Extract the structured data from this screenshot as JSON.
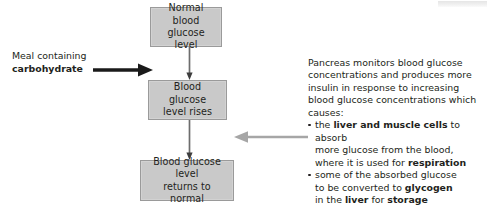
{
  "diagram": {
    "colors": {
      "box_fill": "#c9c9c9",
      "box_border": "#9a9a9a",
      "text": "#231f20",
      "black_arrow": "#1a1a1a",
      "gray_arrow": "#a6a6a6"
    },
    "boxes": [
      {
        "id": "normal",
        "line1": "Normal blood",
        "line2": "glucose level"
      },
      {
        "id": "rises",
        "line1": "Blood glucose",
        "line2": "level rises"
      },
      {
        "id": "returns",
        "line1": "Blood glucose level",
        "line2": "returns to normal"
      }
    ],
    "meal_label": {
      "line1": "Meal containing",
      "line2_bold": "carbohydrate"
    },
    "pancreas_note": {
      "paragraph": [
        "Pancreas monitors blood glucose",
        "concentrations and produces more",
        "insulin in response to increasing",
        "blood glucose concentrations which",
        "causes:"
      ],
      "bullets": [
        {
          "lines": [
            [
              {
                "t": "the ",
                "b": false
              },
              {
                "t": "liver and muscle cells",
                "b": true
              },
              {
                "t": " to absorb",
                "b": false
              }
            ],
            [
              {
                "t": "more glucose from the blood,",
                "b": false
              }
            ],
            [
              {
                "t": "where it is used for ",
                "b": false
              },
              {
                "t": "respiration",
                "b": true
              }
            ]
          ]
        },
        {
          "lines": [
            [
              {
                "t": "some of the absorbed glucose",
                "b": false
              }
            ],
            [
              {
                "t": "to be converted to ",
                "b": false
              },
              {
                "t": "glycogen",
                "b": true
              }
            ],
            [
              {
                "t": "in the ",
                "b": false
              },
              {
                "t": "liver",
                "b": true
              },
              {
                "t": " for ",
                "b": false
              },
              {
                "t": "storage",
                "b": true
              }
            ]
          ]
        }
      ]
    },
    "arrows": {
      "meal_arrow": "arrow-right-thick-black",
      "feedback_arrow": "arrow-left-gray",
      "connector_1": "arrow-down-thin",
      "connector_2": "arrow-down-thin"
    }
  }
}
